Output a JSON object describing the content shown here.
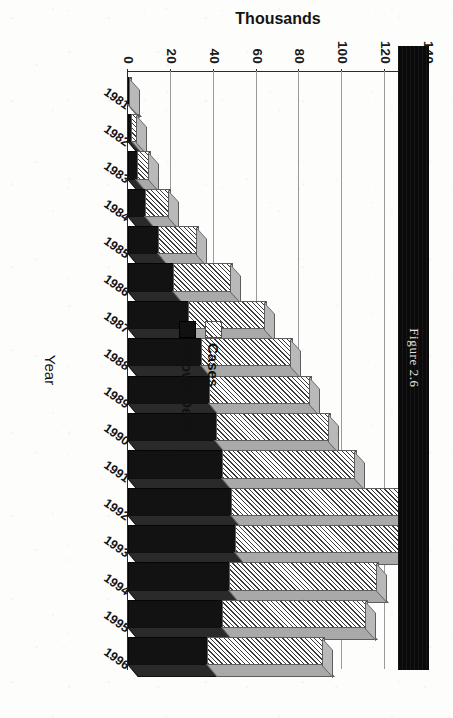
{
  "page": {
    "caption": "Figure 2.6"
  },
  "chart_data": {
    "type": "bar",
    "orientation": "horizontal-rotated",
    "stacked": true,
    "title": "",
    "xlabel": "Year",
    "ylabel": "Thousands",
    "ylim": [
      0,
      140
    ],
    "ytick_labels": [
      "140",
      "120",
      "100",
      "80",
      "60",
      "40",
      "20",
      "0"
    ],
    "yticks": [
      140,
      120,
      100,
      80,
      60,
      40,
      20,
      0
    ],
    "grid": false,
    "legend_position": "upper-left",
    "categories": [
      "1981",
      "1982",
      "1983",
      "1984",
      "1985",
      "1986",
      "1987",
      "1988",
      "1989",
      "1990",
      "1991",
      "1992",
      "1993",
      "1994",
      "1995",
      "1996"
    ],
    "series": [
      {
        "name": "Known Dead",
        "color": "#111111",
        "values": [
          0.3,
          1.5,
          4,
          8,
          14,
          21,
          28,
          34,
          38,
          41,
          44,
          48,
          50,
          47,
          44,
          37
        ]
      },
      {
        "name": "Cases",
        "color": "#d8d8d8",
        "values": [
          0.7,
          2.5,
          6,
          11,
          18,
          27,
          36,
          42,
          47,
          53,
          62,
          82,
          84,
          69,
          67,
          54
        ]
      }
    ],
    "totals": [
      1,
      4,
      10,
      19,
      32,
      48,
      64,
      76,
      85,
      94,
      106,
      130,
      134,
      116,
      111,
      91
    ]
  },
  "legend": {
    "items": [
      {
        "label": "Cases",
        "swatch": "hatched-swatch"
      },
      {
        "label": "Known Dead",
        "swatch": "black-swatch"
      }
    ]
  }
}
